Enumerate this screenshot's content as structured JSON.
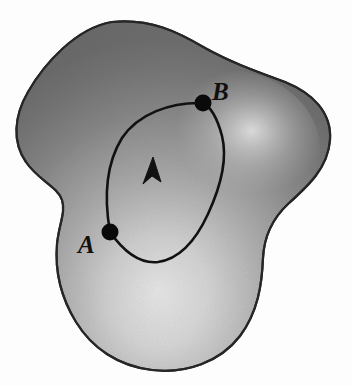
{
  "figure": {
    "name": "closed-path-on-region",
    "background_color": "#fdfdfd",
    "region": {
      "name": "shaded-region",
      "outline_color": "#2b2b2b",
      "outline_width": 2.2,
      "fill_dark": "#6e6e6e",
      "fill_mid": "#9a9a9a",
      "fill_light": "#e6e6e6",
      "highlight_center": {
        "x": 158,
        "y": 298
      },
      "secondary_highlight": {
        "x": 225,
        "y": 150
      }
    },
    "points": [
      {
        "id": "A",
        "label": "A",
        "dot": {
          "x": 110,
          "y": 232,
          "r": 8.5
        },
        "label_pos": {
          "x": 78,
          "y": 253
        },
        "color": "#0a0a0a"
      },
      {
        "id": "B",
        "label": "B",
        "dot": {
          "x": 203,
          "y": 103,
          "r": 8.5
        },
        "label_pos": {
          "x": 212,
          "y": 100
        },
        "color": "#0a0a0a"
      }
    ],
    "paths": [
      {
        "id": "left-path",
        "name": "path-A-to-B-left",
        "from": "A",
        "to": "B",
        "stroke": "#111111",
        "stroke_width": 2.6,
        "has_arrow": true,
        "arrow_direction": "upward",
        "arrow_pos": {
          "x": 152,
          "y": 170
        }
      },
      {
        "id": "right-path",
        "name": "path-A-to-B-right",
        "from": "A",
        "to": "B",
        "stroke": "#111111",
        "stroke_width": 2.6,
        "has_arrow": false
      }
    ],
    "arrow": {
      "name": "direction-arrowhead",
      "color": "#111111",
      "tip": {
        "x": 154,
        "y": 158
      },
      "size": 13
    }
  }
}
